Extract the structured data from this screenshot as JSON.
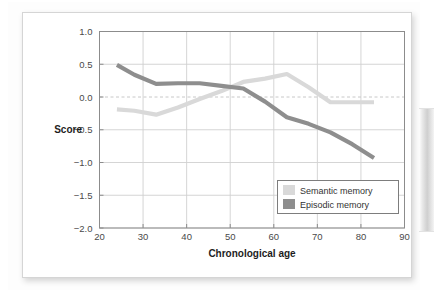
{
  "chart_data": {
    "type": "line",
    "title": "",
    "xlabel": "Chronological age",
    "ylabel": "Score",
    "xlim": [
      20,
      90
    ],
    "ylim": [
      -2.0,
      1.0
    ],
    "grid": true,
    "legend_position": "bottom-right",
    "x_ticks": [
      20,
      30,
      40,
      50,
      60,
      70,
      80,
      90
    ],
    "x_tick_labels": [
      "20",
      "30",
      "40",
      "50",
      "60",
      "70",
      "80",
      "90"
    ],
    "y_ticks": [
      1.0,
      0.5,
      0.0,
      -0.5,
      -1.0,
      -1.5,
      -2.0
    ],
    "y_tick_labels": [
      "1.0",
      "0.5",
      "0.0",
      "−0.5",
      "−1.0",
      "−1.5",
      "−2.0"
    ],
    "reference_lines": [
      {
        "name": "zero-line",
        "axis": "y",
        "value": 0.0,
        "style": "dashed",
        "color": "#c8c8c8"
      }
    ],
    "series": [
      {
        "name": "Semantic memory",
        "color": "#d9d9d9",
        "x": [
          24,
          28,
          33,
          38,
          43,
          48,
          53,
          58,
          63,
          68,
          73,
          78,
          83
        ],
        "values": [
          -0.19,
          -0.21,
          -0.27,
          -0.16,
          -0.03,
          0.09,
          0.23,
          0.28,
          0.35,
          0.15,
          -0.08,
          -0.08,
          -0.08
        ]
      },
      {
        "name": "Episodic memory",
        "color": "#8e8e8e",
        "x": [
          24,
          28,
          33,
          38,
          43,
          48,
          53,
          58,
          63,
          68,
          73,
          78,
          83
        ],
        "values": [
          0.49,
          0.34,
          0.2,
          0.21,
          0.21,
          0.17,
          0.13,
          -0.07,
          -0.31,
          -0.41,
          -0.54,
          -0.72,
          -0.93
        ]
      }
    ]
  },
  "axis": {
    "y_title": "Score",
    "x_title": "Chronological age"
  },
  "legend": {
    "items": [
      {
        "label": "Semantic memory",
        "swatch_color": "#d9d9d9"
      },
      {
        "label": "Episodic memory",
        "swatch_color": "#8e8e8e"
      }
    ]
  },
  "ticks": {
    "x": [
      "20",
      "30",
      "40",
      "50",
      "60",
      "70",
      "80",
      "90"
    ],
    "y": [
      "1.0",
      "0.5",
      "0.0",
      "−0.5",
      "−1.0",
      "−1.5",
      "−2.0"
    ]
  },
  "colors": {
    "semantic": "#d9d9d9",
    "episodic": "#8e8e8e",
    "grid": "#d0d0d0",
    "axis": "#8c8c8c",
    "zero_line": "#c8c8c8",
    "card_background": "#ffffff"
  }
}
